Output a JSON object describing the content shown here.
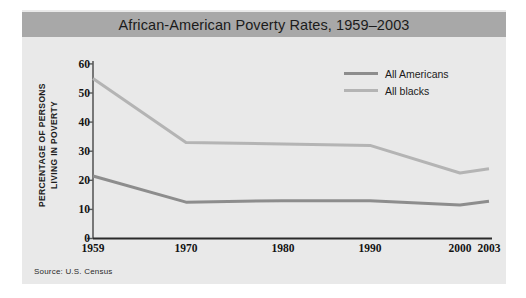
{
  "figure": {
    "title": "African-American Poverty Rates, 1959–2003",
    "source_note": "Source: U.S. Census",
    "title_bar_color": "#a8a8a8",
    "panel_color": "#e9e9e9"
  },
  "legend": {
    "position": "top-right",
    "entries": [
      {
        "label": "All Americans",
        "color": "#8d8d8d"
      },
      {
        "label": "All blacks",
        "color": "#b4b4b4"
      }
    ]
  },
  "axes": {
    "y_title_line1": "PERCENTAGE OF PERSONS",
    "y_title_line2": "LIVING IN POVERTY",
    "y_ticks": [
      "0",
      "10",
      "20",
      "30",
      "40",
      "50",
      "60"
    ],
    "x_ticks": [
      "1959",
      "1970",
      "1980",
      "1990",
      "2000",
      "2003"
    ]
  },
  "chart_data": {
    "type": "line",
    "title": "African-American Poverty Rates, 1959–2003",
    "xlabel": "",
    "ylabel": "PERCENTAGE OF PERSONS LIVING IN POVERTY",
    "x": [
      1959,
      1970,
      1980,
      1990,
      2000,
      2003
    ],
    "xtick_labels": [
      "1959",
      "1970",
      "1980",
      "1990",
      "2000",
      "2003"
    ],
    "ylim": [
      0,
      60
    ],
    "yticks": [
      0,
      10,
      20,
      30,
      40,
      50,
      60
    ],
    "grid": false,
    "legend_position": "top-right",
    "annotations": [
      "Source: U.S. Census"
    ],
    "series": [
      {
        "name": "All blacks",
        "color": "#b4b4b4",
        "values": [
          55,
          33,
          32.5,
          32,
          22.5,
          24
        ]
      },
      {
        "name": "All Americans",
        "color": "#8d8d8d",
        "values": [
          21.5,
          12.5,
          13,
          13,
          11.5,
          12.8
        ]
      }
    ]
  }
}
